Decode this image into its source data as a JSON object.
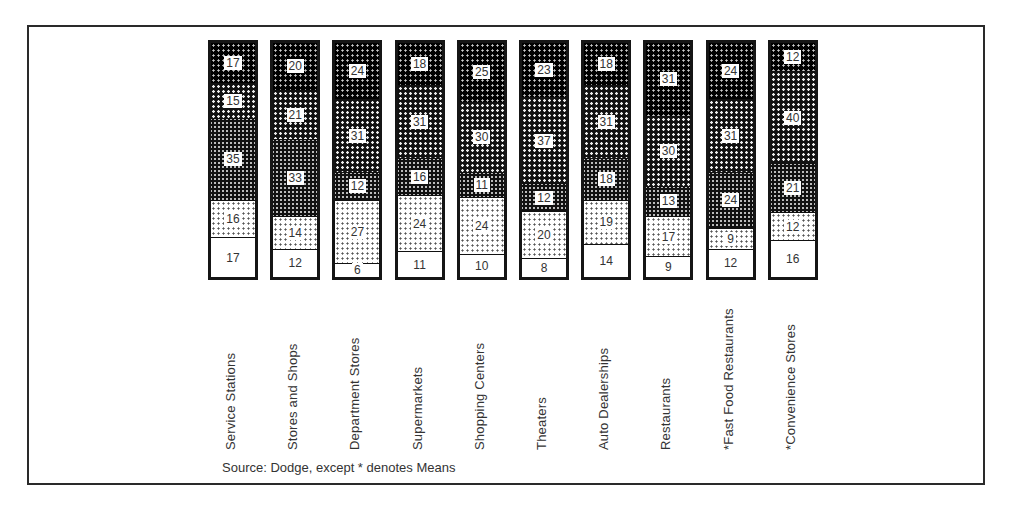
{
  "chart_data": {
    "type": "bar",
    "stacked": true,
    "percent_stacked": true,
    "title": "",
    "xlabel": "",
    "ylabel": "",
    "ylim": [
      0,
      100
    ],
    "grid": false,
    "legend": null,
    "categories": [
      "Service Stations",
      "Stores and Shops",
      "Department Stores",
      "Supermarkets",
      "Shopping Centers",
      "Theaters",
      "Auto Dealerships",
      "Restaurants",
      "*Fast Food Restaurants",
      "*Convenience Stores"
    ],
    "bars": [
      {
        "label": "Service Stations",
        "segments_bottom_to_top": [
          17,
          16,
          35,
          15,
          17
        ]
      },
      {
        "label": "Stores and Shops",
        "segments_bottom_to_top": [
          12,
          14,
          33,
          21,
          20
        ]
      },
      {
        "label": "Department Stores",
        "segments_bottom_to_top": [
          6,
          27,
          12,
          31,
          24
        ]
      },
      {
        "label": "Supermarkets",
        "segments_bottom_to_top": [
          11,
          24,
          16,
          31,
          18
        ]
      },
      {
        "label": "Shopping Centers",
        "segments_bottom_to_top": [
          10,
          24,
          11,
          30,
          25
        ]
      },
      {
        "label": "Theaters",
        "segments_bottom_to_top": [
          8,
          20,
          12,
          37,
          23
        ]
      },
      {
        "label": "Auto Dealerships",
        "segments_bottom_to_top": [
          14,
          19,
          18,
          31,
          18
        ]
      },
      {
        "label": "Restaurants",
        "segments_bottom_to_top": [
          9,
          17,
          13,
          30,
          31
        ]
      },
      {
        "label": "*Fast Food Restaurants",
        "segments_bottom_to_top": [
          12,
          9,
          24,
          31,
          24
        ]
      },
      {
        "label": "*Convenience Stores",
        "segments_bottom_to_top": [
          16,
          12,
          21,
          40,
          12
        ]
      }
    ],
    "patterns_bottom_to_top": [
      "white",
      "light-dots",
      "medium-dots",
      "dense-dots",
      "dark"
    ],
    "annotations": [
      "Source: Dodge, except * denotes Means"
    ]
  },
  "source_note": "Source: Dodge, except * denotes Means"
}
